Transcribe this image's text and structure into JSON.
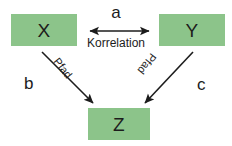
{
  "diagram": {
    "type": "path-analysis-diagram",
    "background_color": "#ffffff",
    "node_fill_color": "#8cc48a",
    "text_color": "#1c1c1c",
    "nodes": [
      {
        "id": "x",
        "label": "X"
      },
      {
        "id": "y",
        "label": "Y"
      },
      {
        "id": "z",
        "label": "Z"
      }
    ],
    "edges": [
      {
        "id": "a",
        "from": "X",
        "to": "Y",
        "coefficient": "a",
        "relation": "Korrelation",
        "arrow": "double-headed"
      },
      {
        "id": "b",
        "from": "X",
        "to": "Z",
        "coefficient": "b",
        "relation": "Pfad",
        "arrow": "single-headed"
      },
      {
        "id": "c",
        "from": "Y",
        "to": "Z",
        "coefficient": "c",
        "relation": "Pfad",
        "arrow": "single-headed"
      }
    ]
  }
}
